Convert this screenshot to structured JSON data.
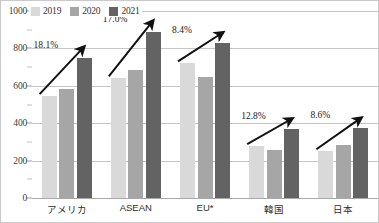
{
  "chart_data": {
    "type": "bar",
    "title": "",
    "xlabel": "",
    "ylabel": "",
    "ylim": [
      0,
      1000
    ],
    "ytick_step": 200,
    "yminor_step": 100,
    "grid": true,
    "legend_position": "top-left",
    "categories": [
      "アメリカ",
      "ASEAN",
      "EU*",
      "韓国",
      "日本"
    ],
    "yticks": [
      "1000",
      "800",
      "600",
      "400",
      "200",
      "0"
    ],
    "series": [
      {
        "name": "2019",
        "color": "#d9d9d9",
        "values": [
          545,
          640,
          720,
          278,
          250
        ]
      },
      {
        "name": "2020",
        "color": "#a6a6a6",
        "values": [
          582,
          682,
          647,
          257,
          283
        ]
      },
      {
        "name": "2021",
        "color": "#636363",
        "values": [
          749,
          888,
          829,
          369,
          372
        ]
      }
    ],
    "annotations": [
      {
        "label": "18.1%",
        "category": "アメリカ"
      },
      {
        "label": "17.0%",
        "category": "ASEAN"
      },
      {
        "label": "8.4%",
        "category": "EU*"
      },
      {
        "label": "12.8%",
        "category": "韓国"
      },
      {
        "label": "8.6%",
        "category": "日本"
      }
    ]
  },
  "legend": {
    "items": [
      {
        "label": "2019",
        "color": "#d9d9d9"
      },
      {
        "label": "2020",
        "color": "#a6a6a6"
      },
      {
        "label": "2021",
        "color": "#636363"
      }
    ]
  }
}
